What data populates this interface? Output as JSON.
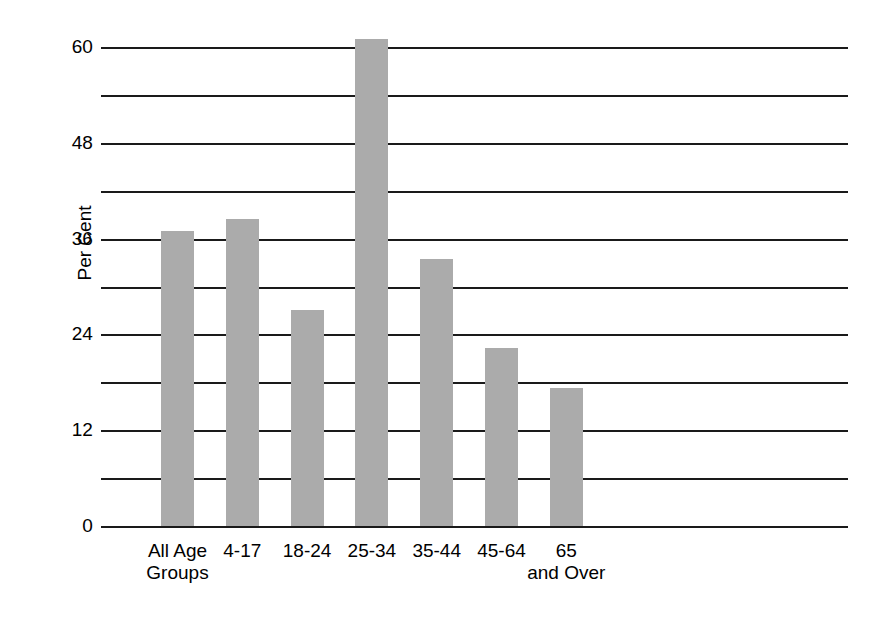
{
  "chart_data": {
    "type": "bar",
    "title": "",
    "subtitle": "",
    "xlabel": "",
    "ylabel": "Per Cent",
    "categories": [
      "All Age\nGroups",
      "4-17",
      "18-24",
      "25-34",
      "35-44",
      "45-64",
      "65\nand Over"
    ],
    "category_lines": [
      [
        "All Age",
        "Groups"
      ],
      [
        "4-17",
        ""
      ],
      [
        "18-24",
        ""
      ],
      [
        "25-34",
        ""
      ],
      [
        "35-44",
        ""
      ],
      [
        "45-64",
        ""
      ],
      [
        "65",
        "and Over"
      ]
    ],
    "values": [
      37,
      38.5,
      27,
      61,
      33.5,
      22.3,
      17.3
    ],
    "series": [
      {
        "name": "Per Cent",
        "values": [
          37,
          38.5,
          27,
          61,
          33.5,
          22.3,
          17.3
        ]
      }
    ],
    "ylim": [
      0,
      62
    ],
    "xlim": [
      0,
      7
    ],
    "y_tick_labels": [
      "0",
      "12",
      "24",
      "36",
      "48",
      "60"
    ],
    "y_tick_values": [
      0,
      12,
      24,
      36,
      48,
      60
    ],
    "y_gridline_values": [
      0,
      6,
      12,
      18,
      24,
      30,
      36,
      42,
      48,
      54,
      60
    ],
    "y_tick_interval": 12,
    "y_gridline_interval": 6,
    "grid": "horizontal",
    "legend": "none",
    "legend_position": "none",
    "annotations": [],
    "bar_color": "#ababab",
    "gridline_color": "#1a1a1a",
    "background_color": "#ffffff",
    "text_color": "#000000"
  }
}
